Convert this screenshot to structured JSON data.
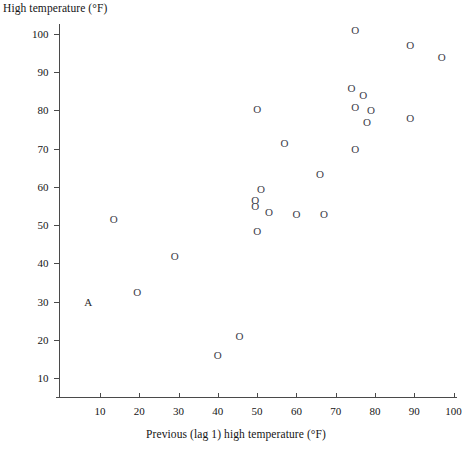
{
  "chart_data": {
    "type": "scatter",
    "title": "",
    "xlabel": "Previous (lag 1) high temperature (°F)",
    "ylabel": "High temperature (°F)",
    "xlim": [
      0,
      101
    ],
    "ylim": [
      0,
      103
    ],
    "xticks": [
      10,
      20,
      30,
      40,
      50,
      60,
      70,
      80,
      90,
      100
    ],
    "yticks": [
      10,
      20,
      30,
      40,
      50,
      60,
      70,
      80,
      90,
      100
    ],
    "xtick_labels": [
      "10",
      "20",
      "30",
      "40",
      "50",
      "60",
      "70",
      "80",
      "90",
      "100"
    ],
    "ytick_labels": [
      "10",
      "20",
      "30",
      "40",
      "50",
      "60",
      "70",
      "80",
      "90",
      "100"
    ],
    "grid": false,
    "legend": null,
    "marker_glyph": "O",
    "points": [
      {
        "x": 7.0,
        "y": 30.0,
        "marker": "A"
      },
      {
        "x": 13.5,
        "y": 51.5,
        "marker": "O"
      },
      {
        "x": 19.5,
        "y": 32.5,
        "marker": "O"
      },
      {
        "x": 29.0,
        "y": 42.0,
        "marker": "O"
      },
      {
        "x": 40.0,
        "y": 16.0,
        "marker": "O"
      },
      {
        "x": 45.5,
        "y": 21.0,
        "marker": "O"
      },
      {
        "x": 49.5,
        "y": 56.5,
        "marker": "O"
      },
      {
        "x": 49.5,
        "y": 55.0,
        "marker": "O"
      },
      {
        "x": 50.0,
        "y": 48.5,
        "marker": "O"
      },
      {
        "x": 50.0,
        "y": 80.5,
        "marker": "O"
      },
      {
        "x": 51.0,
        "y": 59.5,
        "marker": "O"
      },
      {
        "x": 53.0,
        "y": 53.5,
        "marker": "O"
      },
      {
        "x": 57.0,
        "y": 71.5,
        "marker": "O"
      },
      {
        "x": 60.0,
        "y": 53.0,
        "marker": "O"
      },
      {
        "x": 66.0,
        "y": 63.5,
        "marker": "O"
      },
      {
        "x": 67.0,
        "y": 53.0,
        "marker": "O"
      },
      {
        "x": 74.0,
        "y": 86.0,
        "marker": "O"
      },
      {
        "x": 75.0,
        "y": 101.0,
        "marker": "O"
      },
      {
        "x": 75.0,
        "y": 81.0,
        "marker": "O"
      },
      {
        "x": 75.0,
        "y": 70.0,
        "marker": "O"
      },
      {
        "x": 77.0,
        "y": 84.0,
        "marker": "O"
      },
      {
        "x": 78.0,
        "y": 77.0,
        "marker": "O"
      },
      {
        "x": 79.0,
        "y": 80.0,
        "marker": "O"
      },
      {
        "x": 89.0,
        "y": 97.0,
        "marker": "O"
      },
      {
        "x": 89.0,
        "y": 78.0,
        "marker": "O"
      },
      {
        "x": 97.0,
        "y": 94.0,
        "marker": "O"
      }
    ]
  }
}
